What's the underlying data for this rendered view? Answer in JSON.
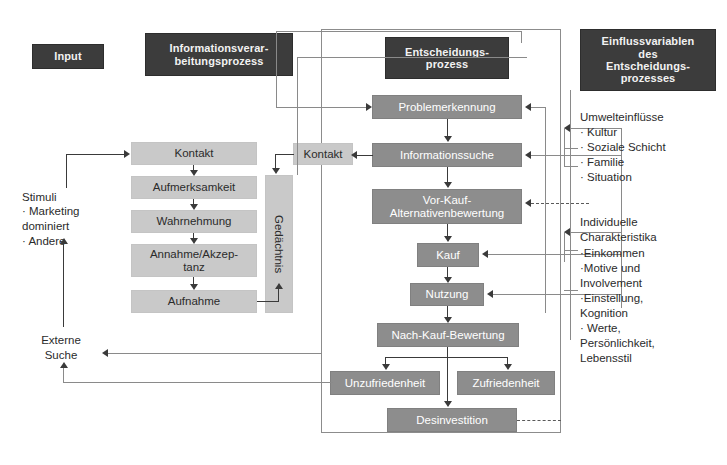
{
  "diagram": {
    "colors": {
      "header_box": "#3c3c3c",
      "process_box": "#8d8d8d",
      "light_box": "#c9c9c9",
      "connector": "#3a3a3a",
      "panel_border": "#8c8c8c",
      "background": "#ffffff"
    }
  },
  "headers": {
    "input": "Input",
    "information_processing": "Informationsverar-\nbeitungsprozess",
    "decision_process": "Entscheidungs-\nprozess",
    "influence_variables": "Einflussvariablen\ndes\nEntscheidungs-\nprozesses"
  },
  "input_column": {
    "stimuli_title": "Stimuli",
    "stimuli_items": "· Marketing\n   dominiert\n· Andere",
    "external_search": "Externe\nSuche"
  },
  "information_processing_steps": [
    {
      "label": "Kontakt"
    },
    {
      "label": "Aufmerksamkeit"
    },
    {
      "label": "Wahrnehmung"
    },
    {
      "label": "Annahme/Akzep-\ntanz"
    },
    {
      "label": "Aufnahme"
    }
  ],
  "memory": {
    "label": "Gedächtnis",
    "contact_label": "Kontakt"
  },
  "decision_process_steps": [
    {
      "label": "Problemerkennung"
    },
    {
      "label": "Informationssuche"
    },
    {
      "label": "Vor-Kauf-\nAlternativenbewertung"
    },
    {
      "label": "Kauf"
    },
    {
      "label": "Nutzung"
    },
    {
      "label": "Nach-Kauf-Bewertung"
    },
    {
      "label": "Unzufriedenheit"
    },
    {
      "label": "Zufriedenheit"
    },
    {
      "label": "Desinvestition"
    }
  ],
  "influence_variables": {
    "environmental_title": "Umwelteinflüsse",
    "environmental_items": "· Kultur\n· Soziale Schicht\n· Familie\n· Situation",
    "individual_title": "Individuelle\nCharakteristika",
    "individual_items": "·Einkommen\n·Motive und\nInvolvement\n·Einstellung,\nKognition\n· Werte,\nPersönlichkeit,\nLebensstil"
  }
}
